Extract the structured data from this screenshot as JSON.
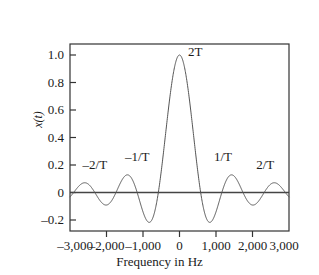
{
  "chart_data": {
    "type": "line",
    "title": "",
    "xlabel": "Frequency in Hz",
    "ylabel": "x(t)",
    "xlim": [
      -3000,
      3000
    ],
    "ylim": [
      -0.28,
      1.08
    ],
    "grid": false,
    "legend": "none",
    "x_ticks": [
      -3000,
      -2000,
      -1000,
      0,
      1000,
      2000,
      3000
    ],
    "x_tick_labels": [
      "–3,000",
      "–2,000",
      "–1,000",
      "0",
      "1,000",
      "2,000",
      "3,000"
    ],
    "y_ticks": [
      -0.2,
      0,
      0.2,
      0.4,
      0.6,
      0.8,
      1.0
    ],
    "y_tick_labels": [
      "–0.2",
      "0",
      "0.2",
      "0.4",
      "0.6",
      "0.8",
      "1.0"
    ],
    "series": [
      {
        "name": "sinc",
        "function": "sinc",
        "peak_value": 1.0,
        "peak_x": 0,
        "first_zero_hz": 580,
        "zero_crossing_spacing_hz": 580,
        "sidelobe_peaks": [
          {
            "x": -2320,
            "y": 0.09
          },
          {
            "x": -1160,
            "y": 0.13
          },
          {
            "x": 1160,
            "y": 0.13
          },
          {
            "x": 2320,
            "y": 0.09
          }
        ],
        "sidelobe_troughs": [
          {
            "x": -1740,
            "y": -0.11
          },
          {
            "x": -870,
            "y": -0.19
          },
          {
            "x": 870,
            "y": -0.19
          },
          {
            "x": 1740,
            "y": -0.11
          }
        ],
        "color": "#555555",
        "line_width": 1
      }
    ],
    "annotations": [
      {
        "text": "2T",
        "x": 430,
        "y": 1.02,
        "data_name": "annotation-2t-peak"
      },
      {
        "text": "–2/T",
        "x": -2320,
        "y": 0.2,
        "data_name": "annotation-neg-2-over-t"
      },
      {
        "text": "–1/T",
        "x": -1160,
        "y": 0.26,
        "data_name": "annotation-neg-1-over-t"
      },
      {
        "text": "1/T",
        "x": 1190,
        "y": 0.26,
        "data_name": "annotation-pos-1-over-t"
      },
      {
        "text": "2/T",
        "x": 2350,
        "y": 0.2,
        "data_name": "annotation-pos-2-over-t"
      }
    ],
    "zero_line": {
      "y": 0,
      "color": "#444444"
    },
    "frame_color": "#333333",
    "background": "#ffffff"
  }
}
